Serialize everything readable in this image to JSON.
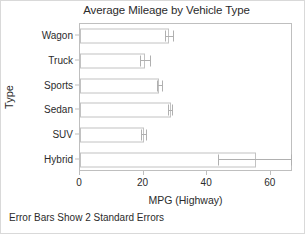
{
  "chart_data": {
    "type": "bar",
    "orientation": "horizontal",
    "title": "Average Mileage by Vehicle Type",
    "xlabel": "MPG (Highway)",
    "ylabel": "Type",
    "footnote": "Error Bars Show 2 Standard Errors",
    "categories": [
      "Wagon",
      "Truck",
      "Sports",
      "Sedan",
      "SUV",
      "Hybrid"
    ],
    "values": [
      28.0,
      20.5,
      25.0,
      28.5,
      20.0,
      55.5
    ],
    "errors_low": [
      26.8,
      19.0,
      24.2,
      27.6,
      19.2,
      43.5
    ],
    "errors_high": [
      29.6,
      22.2,
      26.0,
      29.4,
      21.0,
      67.0
    ],
    "xlim": [
      0,
      67
    ],
    "xticks": [
      0,
      20,
      40,
      60
    ],
    "xtick_labels": [
      "0",
      "20",
      "40",
      "60"
    ],
    "grid": false,
    "legend": null,
    "error_bar_description": "2 Standard Errors",
    "colors": {
      "bar_fill": "#ffffff",
      "bar_stroke": "#c2c2c2",
      "error_bar": "#b0b0b0",
      "axis": "#bfbfbf",
      "text": "#2b2b2b",
      "page_border": "#d9d9d9",
      "background": "#ffffff"
    }
  }
}
